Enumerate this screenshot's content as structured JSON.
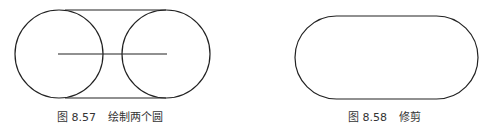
{
  "figures": [
    {
      "id": "fig-8-57",
      "caption_number": "图 8.57",
      "caption_title": "绘制两个圆",
      "shapes": {
        "circle_left": {
          "cx": 59,
          "cy": 54,
          "r": 44
        },
        "circle_right": {
          "cx": 166,
          "cy": 54,
          "r": 44
        },
        "tangent_top": {
          "x1": 65,
          "y1": 10,
          "x2": 166,
          "y2": 10
        },
        "tangent_bottom": {
          "x1": 65,
          "y1": 98,
          "x2": 166,
          "y2": 98
        },
        "center_line": {
          "x1": 58,
          "y1": 54,
          "x2": 167,
          "y2": 54
        }
      }
    },
    {
      "id": "fig-8-58",
      "caption_number": "图 8.58",
      "caption_title": "修剪",
      "shapes": {
        "stadium": {
          "x": 295,
          "y": 16,
          "width": 183,
          "height": 83,
          "rx": 41.5
        }
      }
    }
  ],
  "colors": {
    "stroke": "#222222",
    "caption": "#333333",
    "background": "#ffffff"
  }
}
